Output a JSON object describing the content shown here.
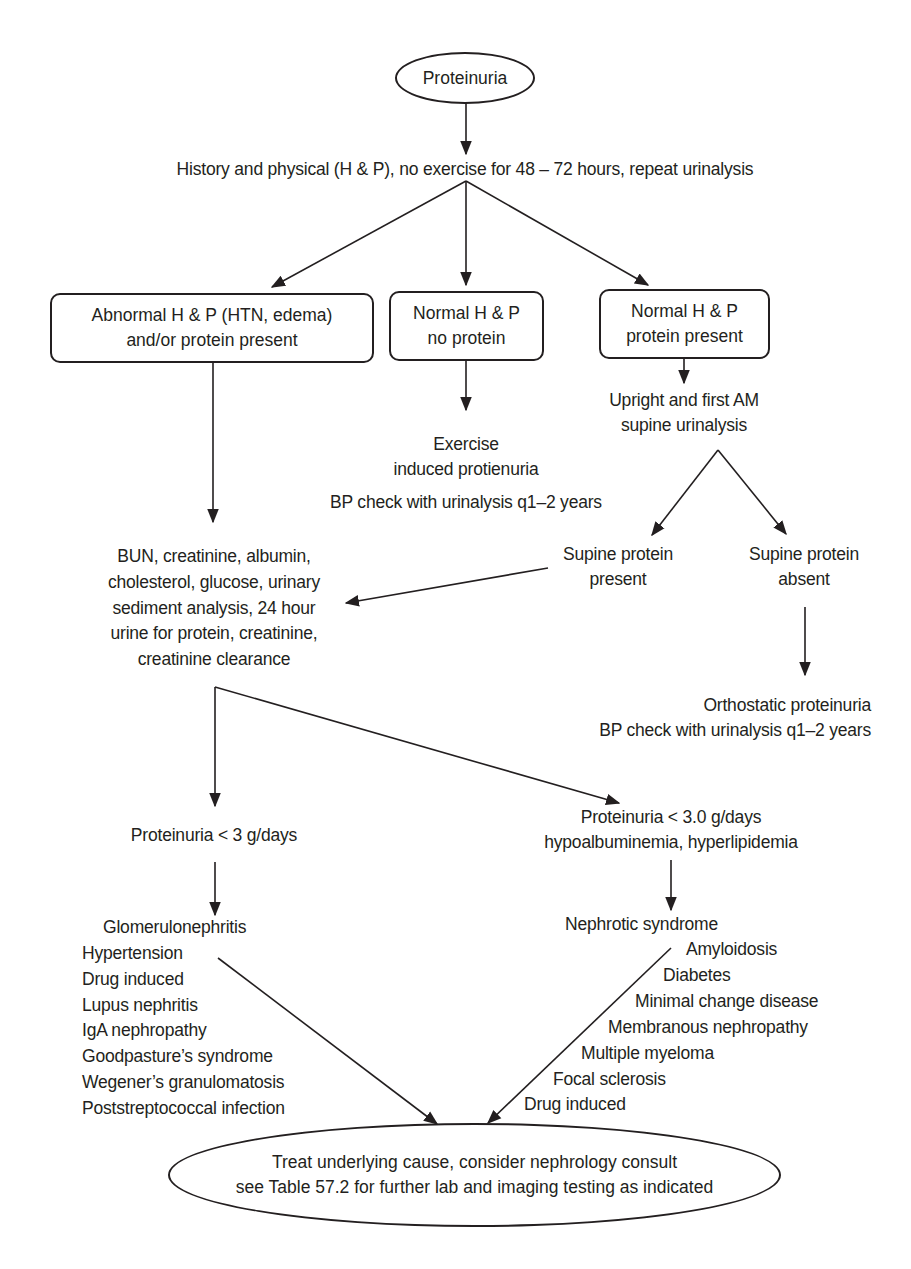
{
  "colors": {
    "ink": "#231f20",
    "background": "#ffffff"
  },
  "start_node": {
    "label": "Proteinuria"
  },
  "step1": {
    "label": "History and physical (H & P), no exercise for 48 – 72 hours, repeat urinalysis"
  },
  "branches": {
    "abnormal": {
      "line1": "Abnormal H & P (HTN, edema)",
      "line2": "and/or protein present"
    },
    "normal_no_protein": {
      "line1": "Normal H & P",
      "line2": "no protein"
    },
    "normal_protein": {
      "line1": "Normal H & P",
      "line2": "protein present"
    }
  },
  "exercise": {
    "line1": "Exercise",
    "line2": "induced protienuria",
    "line3": "BP check with urinalysis q1–2 years"
  },
  "upright_test": {
    "line1": "Upright and first AM",
    "line2": "supine urinalysis"
  },
  "supine_present": {
    "line1": "Supine protein",
    "line2": "present"
  },
  "supine_absent": {
    "line1": "Supine protein",
    "line2": "absent"
  },
  "orthostatic": {
    "line1": "Orthostatic proteinuria",
    "line2": "BP check with urinalysis q1–2 years"
  },
  "labs": {
    "lines": [
      "BUN, creatinine, albumin,",
      "cholesterol, glucose, urinary",
      "sediment analysis, 24 hour",
      "urine for protein, creatinine,",
      "creatinine clearance"
    ]
  },
  "low_protein": {
    "label": "Proteinuria < 3 g/days"
  },
  "high_protein": {
    "line1": "Proteinuria < 3.0 g/days",
    "line2": "hypoalbuminemia, hyperlipidemia"
  },
  "glomerular_list": {
    "header": "Glomerulonephritis",
    "items": [
      "Hypertension",
      "Drug induced",
      "Lupus nephritis",
      "IgA nephropathy",
      "Goodpasture’s syndrome",
      "Wegener’s granulomatosis",
      "Poststreptococcal infection"
    ]
  },
  "nephrotic_list": {
    "header": "Nephrotic syndrome",
    "items": [
      "Amyloidosis",
      "Diabetes",
      "Minimal change disease",
      "Membranous nephropathy",
      "Multiple myeloma",
      "Focal sclerosis",
      "Drug induced"
    ]
  },
  "end_node": {
    "line1": "Treat underlying cause, consider nephrology consult",
    "line2": "see Table 57.2 for further lab and imaging testing as indicated"
  }
}
